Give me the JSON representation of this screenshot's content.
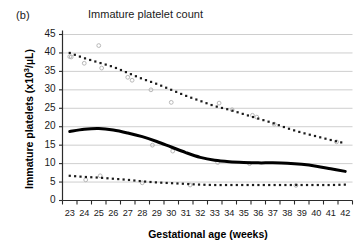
{
  "panel_label": "(b)",
  "colors": {
    "gridline": "#c8c8c8",
    "axis": "#2b2b2b",
    "median_curve": "#000000",
    "percentile_dots": "#1c1c1c",
    "scatter_points": "#b8b8b8",
    "text": "#1a1a1a"
  },
  "chart_data": {
    "type": "line",
    "title": "Immature platelet count",
    "xlabel": "Gestational age (weeks)",
    "ylabel": "Immature platelets (x10³/µL)",
    "ylabel_parts": {
      "prefix": "Immature platelets (x10",
      "exponent": "3",
      "suffix": "/µL)"
    },
    "xlim": [
      22.5,
      42.5
    ],
    "ylim": [
      0,
      45
    ],
    "grid": true,
    "grid_axis": "y",
    "legend": "none",
    "xticks": [
      23,
      24,
      25,
      26,
      27,
      28,
      29,
      30,
      31,
      32,
      33,
      34,
      35,
      36,
      37,
      38,
      39,
      40,
      41,
      42
    ],
    "yticks": [
      0,
      5,
      10,
      15,
      20,
      25,
      30,
      35,
      40,
      45
    ],
    "x": [
      23,
      24,
      25,
      26,
      27,
      28,
      29,
      30,
      31,
      32,
      33,
      34,
      35,
      36,
      37,
      38,
      39,
      40,
      41,
      42
    ],
    "series": [
      {
        "name": "upper percentile (dotted)",
        "style": "dotted",
        "color": "#1c1c1c",
        "values": [
          40.0,
          38.6,
          37.4,
          36.2,
          34.6,
          33.0,
          31.6,
          30.0,
          28.4,
          27.0,
          25.6,
          24.6,
          23.4,
          22.2,
          21.0,
          19.6,
          18.4,
          17.4,
          16.4,
          15.5
        ]
      },
      {
        "name": "median (bold solid)",
        "style": "solid-bold",
        "color": "#000000",
        "values": [
          18.7,
          19.3,
          19.5,
          19.1,
          18.3,
          17.3,
          16.0,
          14.5,
          13.0,
          11.7,
          10.9,
          10.5,
          10.3,
          10.2,
          10.2,
          10.1,
          9.8,
          9.3,
          8.6,
          7.9
        ]
      },
      {
        "name": "lower percentile (dotted)",
        "style": "dotted",
        "color": "#1c1c1c",
        "values": [
          6.7,
          6.4,
          6.2,
          5.9,
          5.6,
          5.2,
          4.9,
          4.7,
          4.5,
          4.3,
          4.2,
          4.2,
          4.2,
          4.2,
          4.2,
          4.2,
          4.2,
          4.2,
          4.2,
          4.3
        ]
      }
    ],
    "scatter_points": [
      {
        "x": 23.0,
        "y": 39.0
      },
      {
        "x": 23.1,
        "y": 38.9
      },
      {
        "x": 24.0,
        "y": 37.2
      },
      {
        "x": 25.0,
        "y": 42.0
      },
      {
        "x": 25.2,
        "y": 35.9
      },
      {
        "x": 27.0,
        "y": 33.4
      },
      {
        "x": 27.3,
        "y": 32.6
      },
      {
        "x": 28.6,
        "y": 30.0
      },
      {
        "x": 30.0,
        "y": 26.6
      },
      {
        "x": 33.3,
        "y": 26.4
      },
      {
        "x": 34.2,
        "y": 24.6
      },
      {
        "x": 35.6,
        "y": 23.1
      },
      {
        "x": 35.9,
        "y": 22.6
      },
      {
        "x": 37.1,
        "y": 20.7
      },
      {
        "x": 41.4,
        "y": 15.9
      },
      {
        "x": 28.7,
        "y": 15.0
      },
      {
        "x": 30.1,
        "y": 13.4
      },
      {
        "x": 33.2,
        "y": 10.3
      },
      {
        "x": 35.4,
        "y": 10.0
      },
      {
        "x": 24.1,
        "y": 5.6
      },
      {
        "x": 25.1,
        "y": 6.7
      },
      {
        "x": 28.0,
        "y": 4.8
      },
      {
        "x": 31.3,
        "y": 4.2
      },
      {
        "x": 38.6,
        "y": 4.1
      }
    ]
  }
}
